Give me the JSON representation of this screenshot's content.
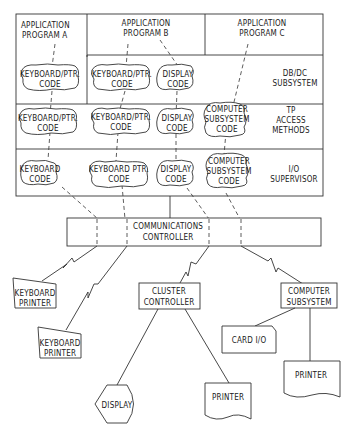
{
  "diagram": {
    "layers": {
      "app_a": [
        "APPLICATION",
        "PROGRAM A"
      ],
      "app_b": [
        "APPLICATION",
        "PROGRAM B"
      ],
      "app_c": [
        "APPLICATION",
        "PROGRAM C"
      ],
      "dbdc": [
        "DB/DC",
        "SUBSYSTEM"
      ],
      "tp": [
        "TP",
        "ACCESS",
        "METHODS"
      ],
      "io": [
        "I/O",
        "SUPERVISOR"
      ]
    },
    "code_modules": {
      "dbdc_a": [
        "KEYBOARD/PTR.",
        "CODE"
      ],
      "dbdc_b1": [
        "KEYBOARD/PTR.",
        "CODE"
      ],
      "dbdc_b2": [
        "DISPLAY",
        "CODE"
      ],
      "tp_a": [
        "KEYBOARD/PTR.",
        "CODE"
      ],
      "tp_b1": [
        "KEYBOARD/PTR.",
        "CODE"
      ],
      "tp_b2": [
        "DISPLAY",
        "CODE"
      ],
      "tp_c": [
        "COMPUTER",
        "SUBSYSTEM",
        "CODE"
      ],
      "io_a": [
        "KEYBOARD",
        "CODE"
      ],
      "io_b1": [
        "KEYBOARD PTR.",
        "CODE"
      ],
      "io_b2": [
        "DISPLAY",
        "CODE"
      ],
      "io_c": [
        "COMPUTER",
        "SUBSYSTEM",
        "CODE"
      ]
    },
    "controller": [
      "COMMUNICATIONS",
      "CONTROLLER"
    ],
    "devices": {
      "kbd_printer_1": [
        "KEYBOARD",
        "PRINTER"
      ],
      "kbd_printer_2": [
        "KEYBOARD",
        "PRINTER"
      ],
      "cluster_controller": [
        "CLUSTER",
        "CONTROLLER"
      ],
      "computer_subsystem": [
        "COMPUTER",
        "SUBSYSTEM"
      ],
      "display": [
        "DISPLAY"
      ],
      "printer_cluster": [
        "PRINTER"
      ],
      "card_io": [
        "CARD I/O"
      ],
      "printer_subsystem": [
        "PRINTER"
      ]
    }
  }
}
